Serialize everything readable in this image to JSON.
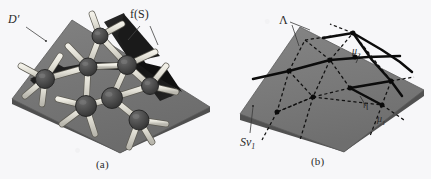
{
  "figure": {
    "caption_a": "(a)",
    "caption_b": "(b)",
    "background_color": "#f7f7f9",
    "plane_color": "#777777",
    "plane_edge_color": "#5e5e5e",
    "sphere_color": "#4a4a4a",
    "rod_color": "#e2e0d8",
    "ribbon_color": "#1d1d1d",
    "line_color": "#111111"
  },
  "panel_a": {
    "name": "ball-and-stick structure on domain plane with folded surface",
    "labels": {
      "domain": "D′",
      "surface": "f(S)"
    },
    "spheres": [
      {
        "cx": 45,
        "cy": 79,
        "r": 9.5
      },
      {
        "cx": 88,
        "cy": 67,
        "r": 9.0
      },
      {
        "cx": 100,
        "cy": 36,
        "r": 8.0
      },
      {
        "cx": 127,
        "cy": 65,
        "r": 9.5
      },
      {
        "cx": 112,
        "cy": 98,
        "r": 10.5
      },
      {
        "cx": 86,
        "cy": 106,
        "r": 10.5
      },
      {
        "cx": 150,
        "cy": 86,
        "r": 8.5
      },
      {
        "cx": 139,
        "cy": 120,
        "r": 10.0
      }
    ],
    "rods": [
      {
        "x1": 45,
        "y1": 79,
        "x2": 88,
        "y2": 67
      },
      {
        "x1": 45,
        "y1": 79,
        "x2": 21,
        "y2": 66
      },
      {
        "x1": 45,
        "y1": 79,
        "x2": 25,
        "y2": 96
      },
      {
        "x1": 45,
        "y1": 79,
        "x2": 42,
        "y2": 104
      },
      {
        "x1": 45,
        "y1": 79,
        "x2": 60,
        "y2": 56
      },
      {
        "x1": 88,
        "y1": 67,
        "x2": 100,
        "y2": 36
      },
      {
        "x1": 88,
        "y1": 67,
        "x2": 127,
        "y2": 65
      },
      {
        "x1": 88,
        "y1": 67,
        "x2": 86,
        "y2": 106
      },
      {
        "x1": 88,
        "y1": 67,
        "x2": 68,
        "y2": 46
      },
      {
        "x1": 100,
        "y1": 36,
        "x2": 122,
        "y2": 24
      },
      {
        "x1": 100,
        "y1": 36,
        "x2": 92,
        "y2": 14
      },
      {
        "x1": 100,
        "y1": 36,
        "x2": 127,
        "y2": 65
      },
      {
        "x1": 127,
        "y1": 65,
        "x2": 150,
        "y2": 86
      },
      {
        "x1": 127,
        "y1": 65,
        "x2": 112,
        "y2": 98
      },
      {
        "x1": 127,
        "y1": 65,
        "x2": 155,
        "y2": 52
      },
      {
        "x1": 112,
        "y1": 98,
        "x2": 86,
        "y2": 106
      },
      {
        "x1": 112,
        "y1": 98,
        "x2": 139,
        "y2": 120
      },
      {
        "x1": 112,
        "y1": 98,
        "x2": 150,
        "y2": 86
      },
      {
        "x1": 86,
        "y1": 106,
        "x2": 62,
        "y2": 124
      },
      {
        "x1": 86,
        "y1": 106,
        "x2": 95,
        "y2": 134
      },
      {
        "x1": 86,
        "y1": 106,
        "x2": 58,
        "y2": 99
      },
      {
        "x1": 150,
        "y1": 86,
        "x2": 176,
        "y2": 92
      },
      {
        "x1": 150,
        "y1": 86,
        "x2": 166,
        "y2": 66
      },
      {
        "x1": 139,
        "y1": 120,
        "x2": 166,
        "y2": 124
      },
      {
        "x1": 139,
        "y1": 120,
        "x2": 129,
        "y2": 147
      },
      {
        "x1": 139,
        "y1": 120,
        "x2": 152,
        "y2": 142
      }
    ]
  },
  "panel_b": {
    "name": "triangulated domain plane with singular curves",
    "labels": {
      "lambda": "Λ",
      "sv1": "Sv",
      "sv1_sub": "1",
      "mu2": "μ",
      "mu2_sub": "2",
      "eta": "η",
      "mu1": "μ",
      "mu1_sub": "1"
    },
    "nodes": [
      {
        "cx": 353,
        "cy": 33
      },
      {
        "cx": 289,
        "cy": 71
      },
      {
        "cx": 330,
        "cy": 60
      },
      {
        "cx": 355,
        "cy": 57
      },
      {
        "cx": 313,
        "cy": 97
      },
      {
        "cx": 277,
        "cy": 112
      },
      {
        "cx": 350,
        "cy": 88
      },
      {
        "cx": 382,
        "cy": 105
      },
      {
        "cx": 391,
        "cy": 81
      }
    ],
    "solid_curves": [
      "M 253 79 L 289 71 L 330 60 L 368 57 L 400 56",
      "M 323 38 L 353 33 L 382 50 L 400 62 L 412 72",
      "M 353 33 L 372 60 L 391 81 L 402 96",
      "M 350 88 L 391 81",
      "M 350 88 L 382 105"
    ],
    "dashed_edges": [
      {
        "x1": 289,
        "y1": 71,
        "x2": 330,
        "y2": 60
      },
      {
        "x1": 330,
        "y1": 60,
        "x2": 353,
        "y2": 33
      },
      {
        "x1": 330,
        "y1": 60,
        "x2": 313,
        "y2": 97
      },
      {
        "x1": 289,
        "y1": 71,
        "x2": 313,
        "y2": 97
      },
      {
        "x1": 289,
        "y1": 71,
        "x2": 277,
        "y2": 112
      },
      {
        "x1": 313,
        "y1": 97,
        "x2": 277,
        "y2": 112
      },
      {
        "x1": 313,
        "y1": 97,
        "x2": 350,
        "y2": 88
      },
      {
        "x1": 350,
        "y1": 88,
        "x2": 330,
        "y2": 60
      },
      {
        "x1": 350,
        "y1": 88,
        "x2": 391,
        "y2": 81
      },
      {
        "x1": 350,
        "y1": 88,
        "x2": 382,
        "y2": 105
      },
      {
        "x1": 313,
        "y1": 97,
        "x2": 382,
        "y2": 105
      },
      {
        "x1": 391,
        "y1": 81,
        "x2": 382,
        "y2": 105
      },
      {
        "x1": 353,
        "y1": 33,
        "x2": 391,
        "y2": 81
      },
      {
        "x1": 289,
        "y1": 71,
        "x2": 305,
        "y2": 40
      },
      {
        "x1": 305,
        "y1": 40,
        "x2": 353,
        "y2": 33
      },
      {
        "x1": 305,
        "y1": 40,
        "x2": 330,
        "y2": 60
      },
      {
        "x1": 277,
        "y1": 112,
        "x2": 262,
        "y2": 140
      },
      {
        "x1": 313,
        "y1": 97,
        "x2": 300,
        "y2": 140
      },
      {
        "x1": 382,
        "y1": 105,
        "x2": 370,
        "y2": 136
      },
      {
        "x1": 382,
        "y1": 105,
        "x2": 404,
        "y2": 120
      },
      {
        "x1": 391,
        "y1": 81,
        "x2": 414,
        "y2": 77
      },
      {
        "x1": 353,
        "y1": 33,
        "x2": 330,
        "y2": 24
      },
      {
        "x1": 277,
        "y1": 112,
        "x2": 313,
        "y2": 97
      }
    ]
  }
}
